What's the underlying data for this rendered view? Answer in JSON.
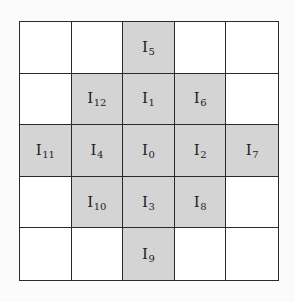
{
  "diagram": {
    "type": "neighborhood-grid",
    "rows": 5,
    "cols": 5,
    "colors": {
      "shaded": "#d4d4d4",
      "empty": "#ffffff",
      "border": "#2a2a2a"
    },
    "cells": [
      [
        {
          "label": "",
          "sub": "",
          "shaded": false
        },
        {
          "label": "",
          "sub": "",
          "shaded": false
        },
        {
          "label": "I",
          "sub": "5",
          "shaded": true
        },
        {
          "label": "",
          "sub": "",
          "shaded": false
        },
        {
          "label": "",
          "sub": "",
          "shaded": false
        }
      ],
      [
        {
          "label": "",
          "sub": "",
          "shaded": false
        },
        {
          "label": "I",
          "sub": "12",
          "shaded": true
        },
        {
          "label": "I",
          "sub": "1",
          "shaded": true
        },
        {
          "label": "I",
          "sub": "6",
          "shaded": true
        },
        {
          "label": "",
          "sub": "",
          "shaded": false
        }
      ],
      [
        {
          "label": "I",
          "sub": "11",
          "shaded": true
        },
        {
          "label": "I",
          "sub": "4",
          "shaded": true
        },
        {
          "label": "I",
          "sub": "0",
          "shaded": true
        },
        {
          "label": "I",
          "sub": "2",
          "shaded": true
        },
        {
          "label": "I",
          "sub": "7",
          "shaded": true
        }
      ],
      [
        {
          "label": "",
          "sub": "",
          "shaded": false
        },
        {
          "label": "I",
          "sub": "10",
          "shaded": true
        },
        {
          "label": "I",
          "sub": "3",
          "shaded": true
        },
        {
          "label": "I",
          "sub": "8",
          "shaded": true
        },
        {
          "label": "",
          "sub": "",
          "shaded": false
        }
      ],
      [
        {
          "label": "",
          "sub": "",
          "shaded": false
        },
        {
          "label": "",
          "sub": "",
          "shaded": false
        },
        {
          "label": "I",
          "sub": "9",
          "shaded": true
        },
        {
          "label": "",
          "sub": "",
          "shaded": false
        },
        {
          "label": "",
          "sub": "",
          "shaded": false
        }
      ]
    ]
  }
}
